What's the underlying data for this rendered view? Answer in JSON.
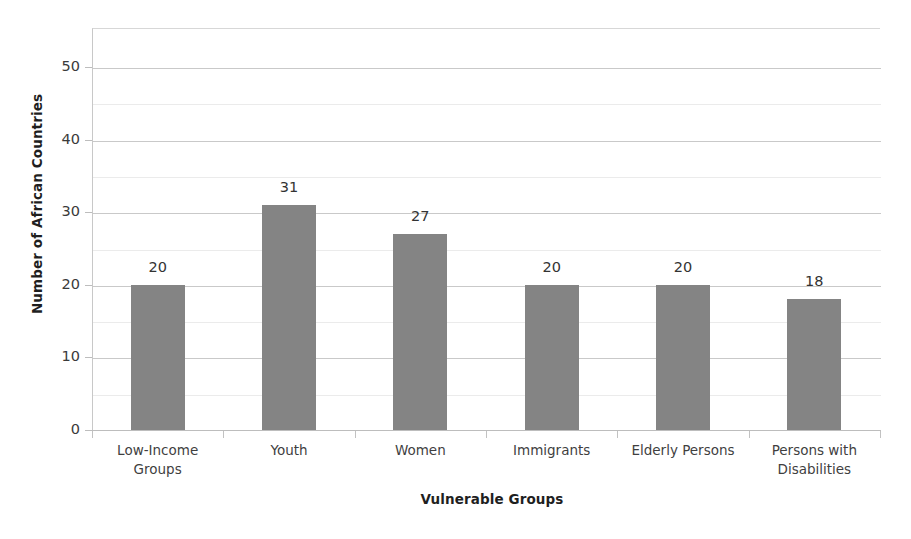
{
  "chart_data": {
    "type": "bar",
    "title": "",
    "xlabel": "Vulnerable Groups",
    "ylabel": "Number of African Countries",
    "categories": [
      "Low-Income Groups",
      "Youth",
      "Women",
      "Immigrants",
      "Elderly Persons",
      "Persons with Disabilities"
    ],
    "category_lines": [
      [
        "Low-Income",
        "Groups"
      ],
      [
        "Youth"
      ],
      [
        "Women"
      ],
      [
        "Immigrants"
      ],
      [
        "Elderly Persons"
      ],
      [
        "Persons with",
        "Disabilities"
      ]
    ],
    "values": [
      20,
      31,
      27,
      20,
      20,
      18
    ],
    "value_labels": [
      "20",
      "31",
      "27",
      "20",
      "20",
      "18"
    ],
    "ylim": [
      0,
      52
    ],
    "ytick_labels": [
      "0",
      "10",
      "20",
      "30",
      "40",
      "50"
    ],
    "ytick_values": [
      0,
      10,
      20,
      30,
      40,
      50
    ],
    "minor_gridline_values": [
      5,
      15,
      25,
      35,
      45
    ],
    "grid": true,
    "legend": "none",
    "bar_color": "#848484",
    "gridline_color_major": "#c9c9c9",
    "gridline_color_minor": "#ebebeb",
    "axis_color": "#bdbdbd",
    "background_color": "#ffffff"
  },
  "axis": {
    "y_title": "Number of African Countries",
    "x_title": "Vulnerable Groups"
  },
  "ticks": {
    "y": [
      {
        "label": "50",
        "value": 50
      },
      {
        "label": "40",
        "value": 40
      },
      {
        "label": "30",
        "value": 30
      },
      {
        "label": "20",
        "value": 20
      },
      {
        "label": "10",
        "value": 10
      },
      {
        "label": "0",
        "value": 0
      }
    ]
  }
}
